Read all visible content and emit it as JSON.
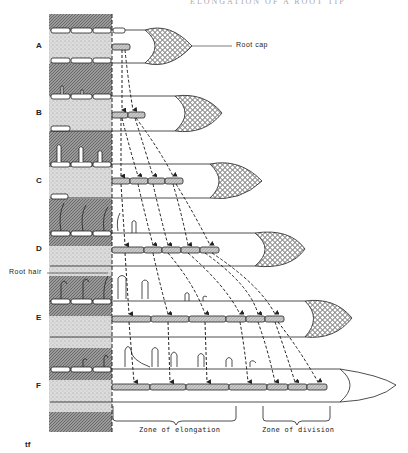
{
  "figure": {
    "header_partial": "ELONGATION OF A ROOT TIP",
    "row_labels": [
      "A",
      "B",
      "C",
      "D",
      "E",
      "F"
    ],
    "callouts": {
      "root_cap": "Root cap",
      "root_hair": "Root hair"
    },
    "zones": {
      "elongation": "Zone of elongation",
      "division": "Zone of division"
    },
    "artist_mark": "tf",
    "colors": {
      "ink": "#222222",
      "soil_dark": "#8a8a8a",
      "soil_light": "#cfcfcf",
      "cell_fill": "#bdbdbd",
      "background": "#ffffff"
    }
  }
}
